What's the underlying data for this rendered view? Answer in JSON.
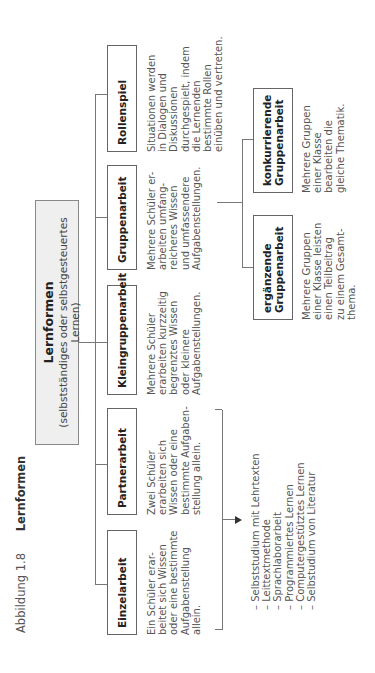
{
  "caption": {
    "figure_number": "Abbildung 1.8",
    "title": "Lernformen"
  },
  "root": {
    "title": "Lernformen",
    "subtitle": "(selbstständiges oder selbstgesteuertes Lernen)"
  },
  "forms": [
    {
      "label": "Einzelarbeit",
      "description": "Ein Schüler erar-\nbeitet sich Wissen\noder eine bestimmte\nAufgabenstellung\nallein."
    },
    {
      "label": "Partnerarbeit",
      "description": "Zwei Schüler\nerarbeiten sich\nWissen oder eine\nbestimmte Aufgaben-\nstellung allein."
    },
    {
      "label": "Kleingruppenarbeit",
      "description": "Mehrere Schüler\nerarbeiten kurzzeitig\nbegrenztes Wissen\noder kleinere\nAufgabenstellungen."
    },
    {
      "label": "Gruppenarbeit",
      "description": "Mehrere Schüler er-\narbeiten umfang-\nreicheres Wissen\nund umfassendere\nAufgabenstellungen."
    },
    {
      "label": "Rollenspiel",
      "description": "Situationen werden\nin Dialogen und\nDiskussionen\ndurchgespielt, indem\ndie Lernenden\nbestimmte Rollen\neinüben und vertreten."
    }
  ],
  "group_subtypes": [
    {
      "label_line1": "ergänzende",
      "label_line2": "Gruppenarbeit",
      "description": "Mehrere Gruppen\neiner Klasse leisten\neinen Teilbeitrag\nzu einem Gesamt-\nthema."
    },
    {
      "label_line1": "konkurrierende",
      "label_line2": "Gruppenarbeit",
      "description": "Mehrere Gruppen\neiner Klasse\nbearbeiten die\ngleiche Thematik."
    }
  ],
  "individual_methods": "– Selbststudium mit Lehrtexten\n– Leittextmethode\n– Sprachlaborarbeit\n– Programmiertes Lernen\n– Computergestütztes Lernen\n– Selbstudium von Literatur"
}
